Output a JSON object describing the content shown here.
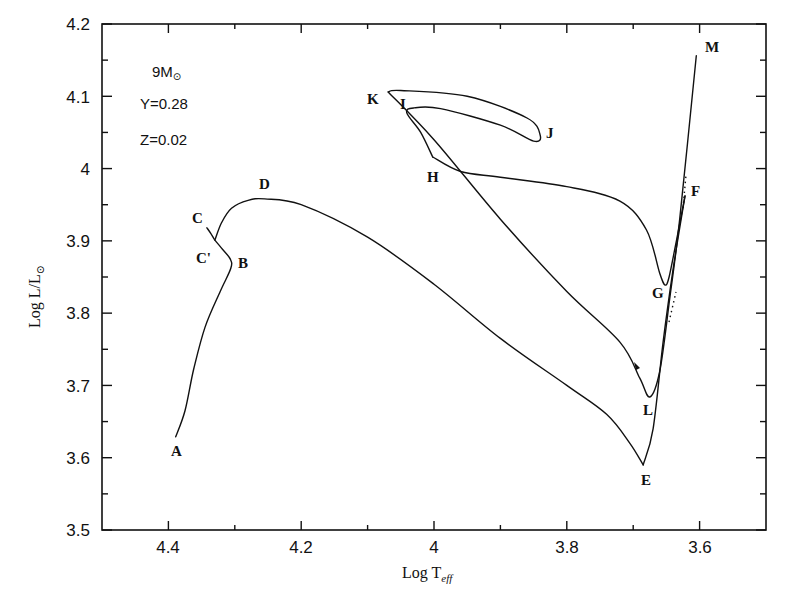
{
  "chart_data": {
    "type": "line",
    "title": "",
    "xlabel": "Log T_eff",
    "ylabel": "Log L/L_sun",
    "xlim": [
      4.5,
      3.5
    ],
    "ylim": [
      3.5,
      4.2
    ],
    "x_inverted": true,
    "grid": false,
    "legend": null,
    "x_ticks": [
      {
        "value": 4.4,
        "label": "4.4"
      },
      {
        "value": 4.2,
        "label": "4.2"
      },
      {
        "value": 4.0,
        "label": "4"
      },
      {
        "value": 3.8,
        "label": "3.8"
      },
      {
        "value": 3.6,
        "label": "3.6"
      }
    ],
    "x_minor_ticks": [
      4.3,
      4.1,
      3.9,
      3.7
    ],
    "y_ticks": [
      {
        "value": 3.5,
        "label": "3.5"
      },
      {
        "value": 3.6,
        "label": "3.6"
      },
      {
        "value": 3.7,
        "label": "3.7"
      },
      {
        "value": 3.8,
        "label": "3.8"
      },
      {
        "value": 3.9,
        "label": "3.9"
      },
      {
        "value": 4.0,
        "label": "4"
      },
      {
        "value": 4.1,
        "label": "4.1"
      },
      {
        "value": 4.2,
        "label": "4.2"
      }
    ],
    "y_minor_ticks": [
      3.55,
      3.65,
      3.75,
      3.85,
      3.95,
      4.05,
      4.15
    ],
    "annotations": [
      {
        "text": "9M⊙",
        "x": 4.44,
        "y": 4.15
      },
      {
        "text": "Y=0.28",
        "x": 4.44,
        "y": 4.1
      },
      {
        "text": "Z=0.02",
        "x": 4.44,
        "y": 4.05
      }
    ],
    "series": [
      {
        "name": "Evolutionary track 9 Msun",
        "points": [
          {
            "x": 4.389,
            "y": 3.629
          },
          {
            "x": 4.375,
            "y": 3.665
          },
          {
            "x": 4.362,
            "y": 3.722
          },
          {
            "x": 4.345,
            "y": 3.78
          },
          {
            "x": 4.322,
            "y": 3.83
          },
          {
            "x": 4.306,
            "y": 3.862
          },
          {
            "x": 4.307,
            "y": 3.875
          },
          {
            "x": 4.32,
            "y": 3.89
          },
          {
            "x": 4.33,
            "y": 3.901
          },
          {
            "x": 4.336,
            "y": 3.91
          },
          {
            "x": 4.342,
            "y": 3.918
          }
        ],
        "segment": "A-B-C'-C"
      },
      {
        "name": "C' to E",
        "points": [
          {
            "x": 4.33,
            "y": 3.901
          },
          {
            "x": 4.32,
            "y": 3.925
          },
          {
            "x": 4.305,
            "y": 3.945
          },
          {
            "x": 4.28,
            "y": 3.956
          },
          {
            "x": 4.255,
            "y": 3.958
          },
          {
            "x": 4.2,
            "y": 3.95
          },
          {
            "x": 4.1,
            "y": 3.905
          },
          {
            "x": 4.0,
            "y": 3.84
          },
          {
            "x": 3.9,
            "y": 3.765
          },
          {
            "x": 3.8,
            "y": 3.7
          },
          {
            "x": 3.74,
            "y": 3.66
          },
          {
            "x": 3.705,
            "y": 3.62
          },
          {
            "x": 3.685,
            "y": 3.59
          }
        ],
        "segment": "C'-D-E"
      },
      {
        "name": "E to F",
        "points": [
          {
            "x": 3.685,
            "y": 3.59
          },
          {
            "x": 3.67,
            "y": 3.64
          },
          {
            "x": 3.655,
            "y": 3.76
          },
          {
            "x": 3.64,
            "y": 3.86
          },
          {
            "x": 3.622,
            "y": 3.962
          }
        ],
        "segment": "E-F"
      },
      {
        "name": "F to G to H",
        "points": [
          {
            "x": 3.622,
            "y": 3.962
          },
          {
            "x": 3.635,
            "y": 3.9
          },
          {
            "x": 3.646,
            "y": 3.85
          },
          {
            "x": 3.652,
            "y": 3.839
          },
          {
            "x": 3.66,
            "y": 3.855
          },
          {
            "x": 3.68,
            "y": 3.915
          },
          {
            "x": 3.72,
            "y": 3.955
          },
          {
            "x": 3.8,
            "y": 3.975
          },
          {
            "x": 3.9,
            "y": 3.988
          },
          {
            "x": 3.96,
            "y": 3.996
          },
          {
            "x": 4.002,
            "y": 4.016
          }
        ],
        "segment": "F-G-H"
      },
      {
        "name": "H to I to J to K",
        "points": [
          {
            "x": 4.002,
            "y": 4.016
          },
          {
            "x": 4.02,
            "y": 4.05
          },
          {
            "x": 4.041,
            "y": 4.077
          },
          {
            "x": 4.03,
            "y": 4.084
          },
          {
            "x": 3.99,
            "y": 4.083
          },
          {
            "x": 3.9,
            "y": 4.06
          },
          {
            "x": 3.85,
            "y": 4.038
          },
          {
            "x": 3.84,
            "y": 4.046
          },
          {
            "x": 3.86,
            "y": 4.07
          },
          {
            "x": 3.95,
            "y": 4.1
          },
          {
            "x": 4.05,
            "y": 4.108
          },
          {
            "x": 4.069,
            "y": 4.106
          }
        ],
        "segment": "H-I-J-K"
      },
      {
        "name": "K to L to M",
        "points": [
          {
            "x": 4.069,
            "y": 4.106
          },
          {
            "x": 4.0,
            "y": 4.04
          },
          {
            "x": 3.9,
            "y": 3.93
          },
          {
            "x": 3.8,
            "y": 3.83
          },
          {
            "x": 3.72,
            "y": 3.76
          },
          {
            "x": 3.69,
            "y": 3.71
          },
          {
            "x": 3.675,
            "y": 3.684
          },
          {
            "x": 3.66,
            "y": 3.72
          },
          {
            "x": 3.645,
            "y": 3.82
          },
          {
            "x": 3.63,
            "y": 3.93
          },
          {
            "x": 3.605,
            "y": 4.156
          }
        ],
        "segment": "K-L-M"
      }
    ],
    "labeled_points": [
      {
        "label": "A",
        "x": 4.389,
        "y": 3.629
      },
      {
        "label": "B",
        "x": 4.306,
        "y": 3.862
      },
      {
        "label": "C'",
        "x": 4.33,
        "y": 3.901
      },
      {
        "label": "C",
        "x": 4.342,
        "y": 3.918
      },
      {
        "label": "D",
        "x": 4.255,
        "y": 3.958
      },
      {
        "label": "E",
        "x": 3.685,
        "y": 3.59
      },
      {
        "label": "F",
        "x": 3.622,
        "y": 3.962
      },
      {
        "label": "G",
        "x": 3.652,
        "y": 3.839
      },
      {
        "label": "H",
        "x": 4.002,
        "y": 4.016
      },
      {
        "label": "I",
        "x": 4.041,
        "y": 4.077
      },
      {
        "label": "J",
        "x": 3.84,
        "y": 4.046
      },
      {
        "label": "K",
        "x": 4.069,
        "y": 4.106
      },
      {
        "label": "L",
        "x": 3.675,
        "y": 3.684
      },
      {
        "label": "M",
        "x": 3.605,
        "y": 4.156
      }
    ]
  },
  "axes": {
    "x_title_main": "Log T",
    "x_title_sub": "eff",
    "y_title_main": "Log L/L",
    "y_title_sub": "⊙"
  },
  "annotation_text": {
    "mass_main": "9M",
    "mass_sub": "⊙",
    "helium": "Y=0.28",
    "metals": "Z=0.02"
  },
  "point_labels": {
    "A": "A",
    "B": "B",
    "C": "C",
    "Cp": "C'",
    "D": "D",
    "E": "E",
    "F": "F",
    "G": "G",
    "H": "H",
    "I": "I",
    "J": "J",
    "K": "K",
    "L": "L",
    "M": "M"
  },
  "tick_labels": {
    "x": [
      "4.4",
      "4.2",
      "4",
      "3.8",
      "3.6"
    ],
    "y": [
      "3.5",
      "3.6",
      "3.7",
      "3.8",
      "3.9",
      "4",
      "4.1",
      "4.2"
    ]
  }
}
